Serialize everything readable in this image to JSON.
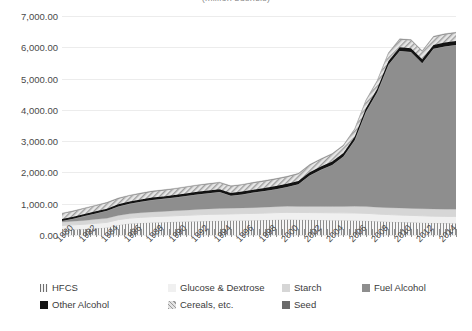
{
  "chart_data": {
    "type": "area",
    "stacked": true,
    "title": "(million bushels)",
    "xlabel": "",
    "ylabel": "",
    "ylim": [
      0,
      7000
    ],
    "yticks": [
      "0.00",
      "1,000.00",
      "2,000.00",
      "3,000.00",
      "4,000.00",
      "5,000.00",
      "6,000.00",
      "7,000.00"
    ],
    "ytick_values": [
      0,
      1000,
      2000,
      3000,
      4000,
      5000,
      6000,
      7000
    ],
    "grid": true,
    "legend_position": "bottom",
    "xlim": [
      1980,
      2015
    ],
    "xtick_labels": [
      "1980",
      "1982",
      "1984",
      "1986",
      "1988",
      "1990",
      "1992",
      "1994",
      "1996",
      "1998",
      "2000",
      "2002",
      "2004",
      "2006",
      "2008",
      "2010",
      "2012",
      "2014"
    ],
    "x": [
      1980,
      1981,
      1982,
      1983,
      1984,
      1985,
      1986,
      1987,
      1988,
      1989,
      1990,
      1991,
      1992,
      1993,
      1994,
      1995,
      1996,
      1997,
      1998,
      1999,
      2000,
      2001,
      2002,
      2003,
      2004,
      2005,
      2006,
      2007,
      2008,
      2009,
      2010,
      2011,
      2012,
      2013,
      2014,
      2015
    ],
    "series": [
      {
        "name": "HFCS",
        "color": "#f4f4f4",
        "pattern": "vertical-lines",
        "values": [
          160,
          175,
          190,
          215,
          240,
          320,
          365,
          385,
          400,
          410,
          420,
          430,
          440,
          450,
          455,
          460,
          465,
          470,
          480,
          490,
          495,
          490,
          485,
          480,
          475,
          470,
          465,
          455,
          440,
          425,
          415,
          405,
          395,
          385,
          380,
          378
        ]
      },
      {
        "name": "Glucose & Dextrose",
        "color": "#f0f0f0",
        "pattern": "solid",
        "values": [
          145,
          150,
          155,
          160,
          165,
          170,
          175,
          180,
          185,
          190,
          195,
          200,
          205,
          210,
          212,
          215,
          218,
          220,
          222,
          225,
          228,
          230,
          232,
          234,
          236,
          238,
          240,
          238,
          232,
          228,
          225,
          222,
          220,
          218,
          216,
          215
        ]
      },
      {
        "name": "Starch",
        "color": "#d6d6d6",
        "pattern": "solid",
        "values": [
          110,
          115,
          120,
          125,
          130,
          135,
          140,
          145,
          150,
          155,
          160,
          165,
          170,
          175,
          178,
          180,
          182,
          185,
          188,
          190,
          192,
          194,
          196,
          198,
          200,
          205,
          210,
          215,
          218,
          220,
          222,
          224,
          226,
          228,
          230,
          230
        ]
      },
      {
        "name": "Fuel Alcohol",
        "color": "#8e8e8e",
        "pattern": "solid",
        "values": [
          35,
          80,
          140,
          190,
          240,
          285,
          315,
          350,
          385,
          400,
          420,
          450,
          480,
          500,
          530,
          400,
          430,
          480,
          520,
          560,
          620,
          710,
          990,
          1170,
          1330,
          1600,
          2110,
          3030,
          3670,
          4570,
          5020,
          5000,
          4650,
          5120,
          5200,
          5250
        ]
      },
      {
        "name": "Other Alcohol",
        "color": "#141414",
        "pattern": "solid",
        "values": [
          60,
          62,
          64,
          66,
          68,
          70,
          72,
          74,
          76,
          78,
          80,
          82,
          84,
          86,
          88,
          90,
          92,
          94,
          96,
          98,
          100,
          102,
          104,
          106,
          108,
          110,
          112,
          114,
          116,
          118,
          120,
          122,
          124,
          126,
          128,
          128
        ]
      },
      {
        "name": "Cereals, etc.",
        "color": "#e2e2e2",
        "pattern": "diagonal-hatch",
        "values": [
          170,
          172,
          175,
          178,
          180,
          182,
          185,
          188,
          190,
          192,
          195,
          198,
          200,
          202,
          205,
          208,
          210,
          212,
          215,
          218,
          220,
          222,
          225,
          228,
          230,
          232,
          235,
          238,
          240,
          242,
          245,
          248,
          250,
          252,
          255,
          255
        ]
      },
      {
        "name": "Seed",
        "color": "#6a6a6a",
        "pattern": "solid",
        "values": [
          18,
          18,
          19,
          19,
          20,
          20,
          20,
          20,
          20,
          20,
          20,
          20,
          21,
          21,
          21,
          21,
          21,
          22,
          22,
          22,
          22,
          22,
          22,
          23,
          23,
          23,
          23,
          24,
          24,
          24,
          24,
          24,
          24,
          24,
          24,
          24
        ]
      }
    ]
  },
  "legend": {
    "items": [
      {
        "label": "HFCS",
        "swatch": "sw-hfcs",
        "icon": "legend-swatch-hfcs"
      },
      {
        "label": "Glucose & Dextrose",
        "swatch": "sw-glu",
        "icon": "legend-swatch-glucose-dextrose"
      },
      {
        "label": "Starch",
        "swatch": "sw-sta",
        "icon": "legend-swatch-starch"
      },
      {
        "label": "Fuel Alcohol",
        "swatch": "sw-fue",
        "icon": "legend-swatch-fuel-alcohol"
      },
      {
        "label": "Other Alcohol",
        "swatch": "sw-oth",
        "icon": "legend-swatch-other-alcohol"
      },
      {
        "label": "Cereals, etc.",
        "swatch": "sw-cer",
        "icon": "legend-swatch-cereals"
      },
      {
        "label": "Seed",
        "swatch": "sw-see",
        "icon": "legend-swatch-seed"
      }
    ]
  }
}
